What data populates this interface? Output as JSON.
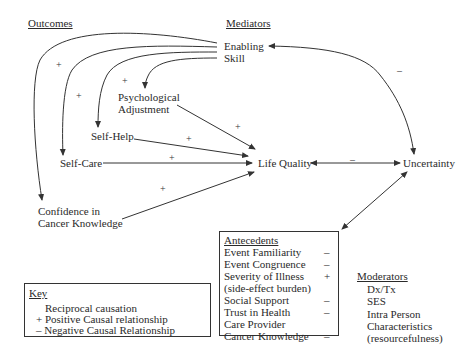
{
  "headings": {
    "outcomes": "Outcomes",
    "mediators": "Mediators"
  },
  "mediators": {
    "enabling": "Enabling",
    "skill": "Skill"
  },
  "outcomes": {
    "psych_line1": "Psychological",
    "psych_line2": "Adjustment",
    "self_help": "Self-Help",
    "self_care": "Self-Care",
    "confidence_line1": "Confidence in",
    "confidence_line2": "Cancer Knowledge"
  },
  "central": {
    "life_quality": "Life Quality",
    "uncertainty": "Uncertainty"
  },
  "signs": {
    "enabling_confidence": "+",
    "enabling_selfcare": "+",
    "skill_psych": "+",
    "psych_lq": "+",
    "selfhelp_lq": "+",
    "selfcare_lq": "+",
    "confidence_lq": "+",
    "lq_uncertainty": "–",
    "enabling_uncertainty": "–"
  },
  "antecedents": {
    "title": "Antecedents",
    "items": [
      {
        "label": "Event Familiarity",
        "sign": "–"
      },
      {
        "label": "Event Congruence",
        "sign": "–"
      },
      {
        "label": "Severity of Illness",
        "sign": "+"
      },
      {
        "label": "(side-effect burden)",
        "sign": ""
      },
      {
        "label": "Social Support",
        "sign": "–"
      },
      {
        "label": "Trust in Health",
        "sign": "–"
      },
      {
        "label": "Care Provider",
        "sign": ""
      },
      {
        "label": "Cancer Knowledge",
        "sign": "–"
      }
    ]
  },
  "moderators": {
    "title": "Moderators",
    "items": [
      "Dx/Tx",
      "SES",
      "Intra Person",
      "Characteristics",
      "(resourcefulness)"
    ]
  },
  "key": {
    "title": "Key",
    "items": [
      "Reciprocal causation",
      "+ Positive Causal relationship",
      "– Negative Causal Relationship"
    ]
  },
  "colors": {
    "line": "#333333",
    "text": "#2a2a2a",
    "background": "#ffffff"
  }
}
